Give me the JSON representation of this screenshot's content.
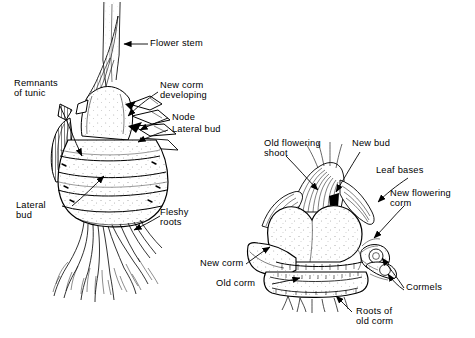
{
  "figure": {
    "background_color": "#ffffff",
    "ink_color": "#000000"
  },
  "left_diagram": {
    "name": "corm-with-roots-diagram",
    "labels": [
      {
        "id": "flower-stem",
        "text": "Flower stem"
      },
      {
        "id": "remnants-of-tunic",
        "text": "Remnants\nof tunic"
      },
      {
        "id": "new-corm-developing",
        "text": "New corm\ndeveloping"
      },
      {
        "id": "node",
        "text": "Node"
      },
      {
        "id": "lateral-bud-upper",
        "text": "Lateral bud"
      },
      {
        "id": "lateral-bud-lower",
        "text": "Lateral\nbud"
      },
      {
        "id": "fleshy-roots",
        "text": "Fleshy\nroots"
      }
    ]
  },
  "right_diagram": {
    "name": "corm-section-diagram",
    "labels": [
      {
        "id": "old-flowering-shoot",
        "text": "Old flowering\nshoot"
      },
      {
        "id": "new-bud",
        "text": "New bud"
      },
      {
        "id": "leaf-bases",
        "text": "Leaf bases"
      },
      {
        "id": "new-flowering-corm",
        "text": "New flowering\ncorm"
      },
      {
        "id": "cormels",
        "text": "Cormels"
      },
      {
        "id": "new-corm",
        "text": "New corm"
      },
      {
        "id": "old-corm",
        "text": "Old corm"
      },
      {
        "id": "roots-of-old-corm",
        "text": "Roots of\nold corm"
      }
    ]
  }
}
